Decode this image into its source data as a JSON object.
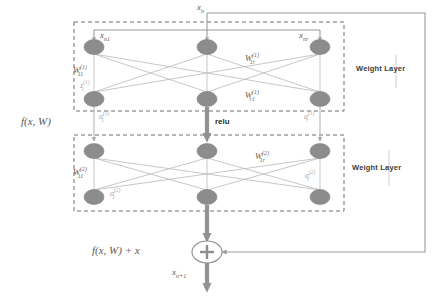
{
  "diagram": {
    "title_label": "Residual Block (ResNet) Diagram",
    "input_label": "x_n",
    "input_label_text": "x",
    "input_label_sub": "n",
    "colors": {
      "node_fill": "#8c8c8c",
      "node_stroke": "#7a7a7a",
      "edge": "#b5b5b5",
      "arrow": "#8c8c8c",
      "thick_arrow": "#8f8f8f",
      "dashed_box": "#6e6e6e",
      "skip_line": "#9a9a9a",
      "text": "#5a5a5a",
      "text_faint": "#a8a8a8",
      "background": "#ffffff"
    },
    "top_input": {
      "text": "x",
      "sub": "n"
    },
    "blocks": [
      {
        "name": "weight-layer-1",
        "side_label": "Weight Layer",
        "node_inputs": [
          {
            "text": "x",
            "sub": "n1"
          },
          {
            "text": "x",
            "sub": "n"
          },
          {
            "text": "x",
            "sub": "nr"
          }
        ],
        "weight_labels": [
          {
            "text": "W",
            "sub": "11",
            "sup": "(1)"
          },
          {
            "text": "W",
            "sub": "1r",
            "sup": "(1)"
          },
          {
            "text": "W",
            "sub": "r1",
            "sup": "(1)"
          }
        ],
        "state_label": {
          "text": "z",
          "sub": "1",
          "sup": "(1)"
        },
        "activations": [
          {
            "text": "a",
            "sub": "1",
            "sup": "(1)"
          },
          {
            "text": "a",
            "sub": "r",
            "sup": "(1)"
          }
        ]
      },
      {
        "name": "weight-layer-2",
        "side_label": "Weight Layer",
        "weight_labels": [
          {
            "text": "W",
            "sub": "11",
            "sup": "(2)"
          },
          {
            "text": "W",
            "sub": "1r",
            "sup": "(2)"
          }
        ],
        "activations": [
          {
            "text": "a",
            "sub": "1",
            "sup": "(2)"
          },
          {
            "text": "a",
            "sub": "r",
            "sup": "(2)"
          }
        ]
      }
    ],
    "activation_fn": "relu",
    "function_label": "f(x, W)",
    "sum_label": "f(x, W) + x",
    "sum_symbol": "+",
    "output_label": {
      "text": "x",
      "sub": "n+1"
    },
    "node_count_per_row": 3,
    "row_count": 4
  }
}
